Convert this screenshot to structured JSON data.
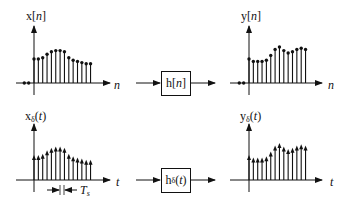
{
  "colors": {
    "ink": "#111111",
    "background": "#ffffff"
  },
  "plots": {
    "x_n": {
      "label_main": "x[",
      "label_var": "n",
      "label_end": "]",
      "axis_label": "n",
      "values": [
        20,
        20,
        21,
        24,
        26,
        27,
        27,
        26,
        21,
        19,
        18,
        17,
        16,
        16
      ],
      "pre_zero_dots": 2
    },
    "y_n": {
      "label_main": "y[",
      "label_var": "n",
      "label_end": "]",
      "axis_label": "n",
      "values": [
        20,
        18,
        18,
        18,
        19,
        23,
        28,
        30,
        27,
        25,
        26,
        28,
        29,
        28
      ],
      "pre_zero_dots": 2
    },
    "x_delta": {
      "label_main": "x",
      "label_sub": "δ",
      "label_open": "(",
      "label_var": "t",
      "label_end": ")",
      "axis_label": "t",
      "values": [
        20,
        20,
        21,
        24,
        26,
        27,
        27,
        26,
        21,
        19,
        18,
        17,
        16,
        16
      ],
      "spacing_label": "T",
      "spacing_sub": "s"
    },
    "y_delta": {
      "label_main": "y",
      "label_sub": "δ",
      "label_open": "(",
      "label_var": "t",
      "label_end": ")",
      "axis_label": "t",
      "values": [
        20,
        18,
        18,
        18,
        19,
        23,
        28,
        30,
        27,
        25,
        26,
        28,
        29,
        28
      ]
    }
  },
  "blocks": {
    "discrete": {
      "label_main": "h[",
      "label_var": "n",
      "label_end": "]"
    },
    "continuous": {
      "label_main": "h",
      "label_sub": "δ",
      "label_open": "(",
      "label_var": "t",
      "label_end": ")"
    }
  }
}
